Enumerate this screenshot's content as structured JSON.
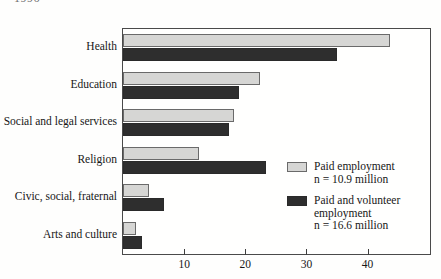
{
  "year_caption": "1996",
  "chart_data": {
    "type": "bar",
    "orientation": "horizontal",
    "title": "",
    "subtitle": "",
    "xlabel": "",
    "ylabel": "",
    "xlim": [
      0,
      50.2
    ],
    "grid": false,
    "legend_position": "inside-right",
    "categories": [
      "Health",
      "Education",
      "Social and legal services",
      "Religion",
      "Civic, social, fraternal",
      "Arts and culture"
    ],
    "series": [
      {
        "name": "Paid employment",
        "note": "n = 10.9 million",
        "color": "#d6d6d4",
        "values": [
          43.6,
          22.4,
          18.2,
          12.4,
          4.2,
          2.2
        ]
      },
      {
        "name": "Paid and volunteer employment",
        "note": "n = 16.6 million",
        "color": "#2e2e2e",
        "values": [
          35.0,
          18.9,
          17.4,
          23.4,
          6.7,
          3.1
        ]
      }
    ],
    "xticks": [
      10,
      20,
      30,
      40
    ],
    "xtick_labels": [
      "10",
      "20",
      "30",
      "40"
    ]
  },
  "legend": {
    "items": [
      {
        "label": "Paid employment",
        "sublabel": "",
        "count": "n = 10.9 million",
        "swatch": "light"
      },
      {
        "label": "Paid and volunteer",
        "sublabel": "employment",
        "count": "n = 16.6 million",
        "swatch": "dark"
      }
    ]
  }
}
